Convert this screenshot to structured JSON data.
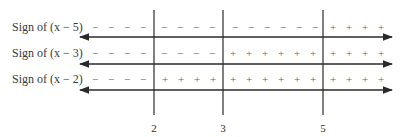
{
  "critical_points": [
    {
      "value": "2",
      "x": 154
    },
    {
      "value": "3",
      "x": 223
    },
    {
      "value": "5",
      "x": 323
    }
  ],
  "rows": [
    {
      "label_prefix": "Sign of ",
      "factor": "(x − 5)",
      "y": 20,
      "line_y": 37,
      "signs": [
        {
          "x": 95,
          "s": "−"
        },
        {
          "x": 111,
          "s": "−"
        },
        {
          "x": 127,
          "s": "−"
        },
        {
          "x": 143,
          "s": "−"
        },
        {
          "x": 164,
          "s": "−"
        },
        {
          "x": 180,
          "s": "−"
        },
        {
          "x": 196,
          "s": "−"
        },
        {
          "x": 212,
          "s": "−"
        },
        {
          "x": 235,
          "s": "−"
        },
        {
          "x": 251,
          "s": "−"
        },
        {
          "x": 267,
          "s": "−"
        },
        {
          "x": 283,
          "s": "−"
        },
        {
          "x": 299,
          "s": "−"
        },
        {
          "x": 315,
          "s": "−"
        },
        {
          "x": 333,
          "s": "+"
        },
        {
          "x": 349,
          "s": "+"
        },
        {
          "x": 365,
          "s": "+"
        },
        {
          "x": 381,
          "s": "+"
        }
      ]
    },
    {
      "label_prefix": "Sign of ",
      "factor": "(x − 3)",
      "y": 46,
      "line_y": 64,
      "signs": [
        {
          "x": 95,
          "s": "−"
        },
        {
          "x": 111,
          "s": "−"
        },
        {
          "x": 127,
          "s": "−"
        },
        {
          "x": 143,
          "s": "−"
        },
        {
          "x": 164,
          "s": "−"
        },
        {
          "x": 180,
          "s": "−"
        },
        {
          "x": 196,
          "s": "−"
        },
        {
          "x": 212,
          "s": "−"
        },
        {
          "x": 233,
          "s": "+"
        },
        {
          "x": 249,
          "s": "+"
        },
        {
          "x": 265,
          "s": "+"
        },
        {
          "x": 281,
          "s": "+"
        },
        {
          "x": 297,
          "s": "+"
        },
        {
          "x": 313,
          "s": "+"
        },
        {
          "x": 333,
          "s": "+"
        },
        {
          "x": 349,
          "s": "+"
        },
        {
          "x": 365,
          "s": "+"
        },
        {
          "x": 381,
          "s": "+"
        }
      ]
    },
    {
      "label_prefix": "Sign of ",
      "factor": "(x − 2)",
      "y": 72,
      "line_y": 90,
      "signs": [
        {
          "x": 95,
          "s": "−"
        },
        {
          "x": 111,
          "s": "−"
        },
        {
          "x": 127,
          "s": "−"
        },
        {
          "x": 143,
          "s": "−"
        },
        {
          "x": 165,
          "s": "+"
        },
        {
          "x": 181,
          "s": "+"
        },
        {
          "x": 197,
          "s": "+"
        },
        {
          "x": 213,
          "s": "+"
        },
        {
          "x": 233,
          "s": "+"
        },
        {
          "x": 249,
          "s": "+"
        },
        {
          "x": 265,
          "s": "+"
        },
        {
          "x": 281,
          "s": "+"
        },
        {
          "x": 297,
          "s": "+"
        },
        {
          "x": 313,
          "s": "+"
        },
        {
          "x": 333,
          "s": "+"
        },
        {
          "x": 349,
          "s": "+"
        },
        {
          "x": 365,
          "s": "+"
        },
        {
          "x": 381,
          "s": "+"
        }
      ]
    }
  ],
  "colors": {
    "line": "#2a2a2a",
    "text": "#3a3a3a",
    "sign": "#666666"
  }
}
